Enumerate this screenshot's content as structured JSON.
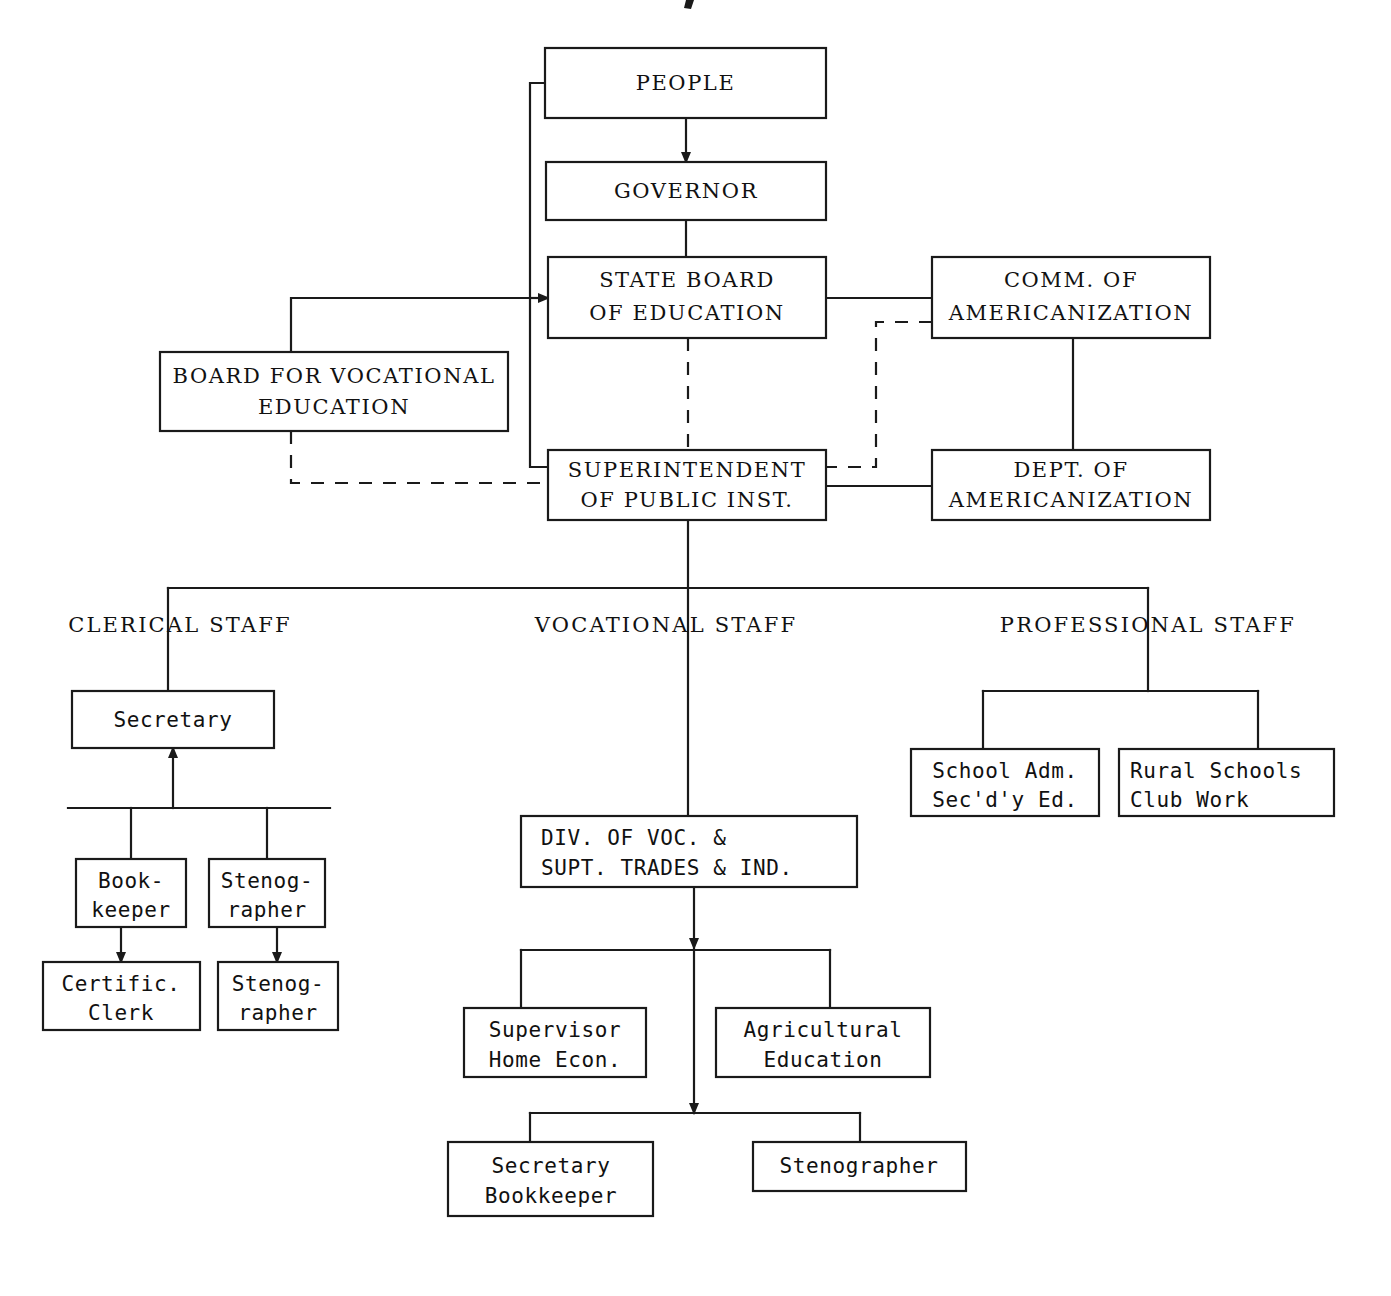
{
  "document": {
    "kind": "organization-chart",
    "title": "State Department of Public Instruction Organization Chart"
  },
  "nodes": {
    "people": {
      "id": "people",
      "lines": [
        "PEOPLE"
      ],
      "x": 545,
      "y": 48,
      "w": 281,
      "h": 70,
      "style": "serif"
    },
    "governor": {
      "id": "governor",
      "lines": [
        "GOVERNOR"
      ],
      "x": 546,
      "y": 162,
      "w": 280,
      "h": 58,
      "style": "serif"
    },
    "state_board": {
      "id": "state_board",
      "lines": [
        "STATE BOARD",
        "OF EDUCATION"
      ],
      "x": 548,
      "y": 257,
      "w": 278,
      "h": 81,
      "style": "serif"
    },
    "comm_amer": {
      "id": "comm_amer",
      "lines": [
        "COMM. OF",
        "AMERICANIZATION"
      ],
      "x": 932,
      "y": 257,
      "w": 278,
      "h": 81,
      "style": "serif"
    },
    "board_voc": {
      "id": "board_voc",
      "lines": [
        "BOARD FOR VOCATIONAL",
        "EDUCATION"
      ],
      "x": 160,
      "y": 352,
      "w": 348,
      "h": 79,
      "style": "serif"
    },
    "superintendent": {
      "id": "superintendent",
      "lines": [
        "SUPERINTENDENT",
        "OF PUBLIC INST."
      ],
      "x": 548,
      "y": 450,
      "w": 278,
      "h": 70,
      "style": "serif"
    },
    "dept_amer": {
      "id": "dept_amer",
      "lines": [
        "DEPT. OF",
        "AMERICANIZATION"
      ],
      "x": 932,
      "y": 450,
      "w": 278,
      "h": 70,
      "style": "serif"
    },
    "secretary": {
      "id": "secretary",
      "lines": [
        "Secretary"
      ],
      "x": 72,
      "y": 691,
      "w": 202,
      "h": 57,
      "style": "mono"
    },
    "bookkeeper": {
      "id": "bookkeeper",
      "lines": [
        "Book-",
        "keeper"
      ],
      "x": 76,
      "y": 859,
      "w": 110,
      "h": 68,
      "style": "mono"
    },
    "stenographer1": {
      "id": "stenographer1",
      "lines": [
        "Stenog-",
        "rapher"
      ],
      "x": 209,
      "y": 859,
      "w": 116,
      "h": 68,
      "style": "mono"
    },
    "certific_clerk": {
      "id": "certific_clerk",
      "lines": [
        "Certific.",
        "Clerk"
      ],
      "x": 43,
      "y": 962,
      "w": 157,
      "h": 68,
      "style": "mono"
    },
    "stenographer2": {
      "id": "stenographer2",
      "lines": [
        "Stenog-",
        "rapher"
      ],
      "x": 218,
      "y": 962,
      "w": 120,
      "h": 68,
      "style": "mono"
    },
    "div_voc": {
      "id": "div_voc",
      "lines": [
        "DIV. OF VOC. &",
        "SUPT. TRADES & IND."
      ],
      "x": 521,
      "y": 816,
      "w": 336,
      "h": 71,
      "style": "mono"
    },
    "supervisor": {
      "id": "supervisor",
      "lines": [
        "Supervisor",
        "Home Econ."
      ],
      "x": 464,
      "y": 1008,
      "w": 182,
      "h": 69,
      "style": "mono"
    },
    "agricultural": {
      "id": "agricultural",
      "lines": [
        "Agricultural",
        "Education"
      ],
      "x": 716,
      "y": 1008,
      "w": 214,
      "h": 69,
      "style": "mono"
    },
    "sec_bookkeeper": {
      "id": "sec_bookkeeper",
      "lines": [
        "Secretary",
        "Bookkeeper"
      ],
      "x": 448,
      "y": 1142,
      "w": 205,
      "h": 74,
      "style": "mono"
    },
    "stenographer3": {
      "id": "stenographer3",
      "lines": [
        "Stenographer"
      ],
      "x": 753,
      "y": 1142,
      "w": 213,
      "h": 49,
      "style": "mono"
    },
    "school_adm": {
      "id": "school_adm",
      "lines": [
        "School Adm.",
        "Sec'd'y Ed."
      ],
      "x": 911,
      "y": 749,
      "w": 188,
      "h": 67,
      "style": "mono"
    },
    "rural_schools": {
      "id": "rural_schools",
      "lines": [
        "Rural Schools",
        "Club Work"
      ],
      "x": 1119,
      "y": 749,
      "w": 215,
      "h": 67,
      "style": "mono"
    }
  },
  "group_labels": [
    {
      "id": "clerical-staff",
      "text": "CLERICAL STAFF",
      "x": 180,
      "y": 626
    },
    {
      "id": "vocational-staff",
      "text": "VOCATIONAL STAFF",
      "x": 666,
      "y": 626
    },
    {
      "id": "professional-staff",
      "text": "PROFESSIONAL STAFF",
      "x": 1148,
      "y": 626
    }
  ],
  "connections": [
    {
      "id": "people-to-governor",
      "from": "people",
      "to": "governor",
      "style": "solid",
      "arrow": true
    },
    {
      "id": "governor-to-state-board",
      "from": "governor",
      "to": "state_board",
      "style": "solid",
      "arrow": false
    },
    {
      "id": "people-left-to-state-board",
      "from": "people",
      "to": "state_board",
      "style": "solid",
      "arrow": true
    },
    {
      "id": "people-left-to-superintendent",
      "from": "people",
      "to": "superintendent",
      "style": "solid",
      "arrow": false
    },
    {
      "id": "board-voc-to-state-board",
      "from": "board_voc",
      "to": "state_board",
      "style": "solid",
      "arrow": true
    },
    {
      "id": "board-voc-to-superintendent",
      "from": "board_voc",
      "to": "superintendent",
      "style": "dashed",
      "arrow": false
    },
    {
      "id": "state-board-to-comm-amer",
      "from": "state_board",
      "to": "comm_amer",
      "style": "solid",
      "arrow": false
    },
    {
      "id": "state-board-to-superintendent",
      "from": "state_board",
      "to": "superintendent",
      "style": "dashed",
      "arrow": false
    },
    {
      "id": "comm-amer-to-dept-amer",
      "from": "comm_amer",
      "to": "dept_amer",
      "style": "solid",
      "arrow": false
    },
    {
      "id": "comm-amer-to-superintendent",
      "from": "comm_amer",
      "to": "superintendent",
      "style": "dashed",
      "arrow": false
    },
    {
      "id": "superintendent-to-dept-amer",
      "from": "superintendent",
      "to": "dept_amer",
      "style": "solid",
      "arrow": false
    },
    {
      "id": "superintendent-to-staff-bar",
      "from": "superintendent",
      "to": "staff_bar",
      "style": "solid",
      "arrow": false
    },
    {
      "id": "staff-bar-to-clerical",
      "from": "staff_bar",
      "to": "secretary",
      "style": "solid",
      "arrow": false
    },
    {
      "id": "staff-bar-to-vocational",
      "from": "staff_bar",
      "to": "div_voc",
      "style": "solid",
      "arrow": false
    },
    {
      "id": "staff-bar-to-professional",
      "from": "staff_bar",
      "to": "school_adm",
      "style": "solid",
      "arrow": false
    },
    {
      "id": "secretary-to-clerk-bar",
      "from": "secretary",
      "to": "bookkeeper",
      "style": "solid",
      "arrow": true
    },
    {
      "id": "clerk-bar-to-stenographer1",
      "from": "secretary",
      "to": "stenographer1",
      "style": "solid",
      "arrow": false
    },
    {
      "id": "bookkeeper-to-certific-clerk",
      "from": "bookkeeper",
      "to": "certific_clerk",
      "style": "solid",
      "arrow": true
    },
    {
      "id": "stenog1-to-stenog2",
      "from": "stenographer1",
      "to": "stenographer2",
      "style": "solid",
      "arrow": true
    },
    {
      "id": "div-voc-to-supervisor",
      "from": "div_voc",
      "to": "supervisor",
      "style": "solid",
      "arrow": false
    },
    {
      "id": "div-voc-to-agricultural",
      "from": "div_voc",
      "to": "agricultural",
      "style": "solid",
      "arrow": false
    },
    {
      "id": "div-voc-to-sec-bookkeeper",
      "from": "div_voc",
      "to": "sec_bookkeeper",
      "style": "solid",
      "arrow": true
    },
    {
      "id": "div-voc-to-stenographer3",
      "from": "div_voc",
      "to": "stenographer3",
      "style": "solid",
      "arrow": false
    },
    {
      "id": "prof-to-school-adm",
      "from": "school_adm",
      "to": "rural_schools",
      "style": "solid",
      "arrow": false
    }
  ],
  "colors": {
    "ink": "#1a1a1a",
    "paper": "#ffffff",
    "text": "#111111"
  }
}
